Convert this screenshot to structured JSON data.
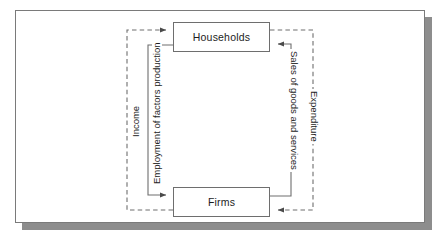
{
  "figure": {
    "type": "circular-flow-diagram",
    "entities": [
      {
        "id": "households",
        "label": "Households"
      },
      {
        "id": "firms",
        "label": "Firms"
      }
    ],
    "flows": [
      {
        "id": "income",
        "label": "Income",
        "style": "dashed",
        "side": "left",
        "from": "firms",
        "to": "households",
        "orientation": "bottom-to-top"
      },
      {
        "id": "employment-of-factors-production",
        "label": "Employment of factors production",
        "style": "solid",
        "side": "left",
        "from": "households",
        "to": "firms",
        "orientation": "bottom-to-top"
      },
      {
        "id": "sales-of-goods-and-services",
        "label": "Sales of goods and services",
        "style": "solid",
        "side": "right",
        "from": "firms",
        "to": "households",
        "orientation": "top-to-bottom"
      },
      {
        "id": "expenditure",
        "label": "Expenditure",
        "style": "dashed",
        "side": "right",
        "from": "households",
        "to": "firms",
        "orientation": "top-to-bottom"
      }
    ],
    "colors": {
      "stroke": "#6e6e6e",
      "text": "#1d1d1d",
      "panel_background": "#ffffff",
      "panel_border": "#7a7a7a",
      "shadow": "#8d8d8d"
    }
  }
}
